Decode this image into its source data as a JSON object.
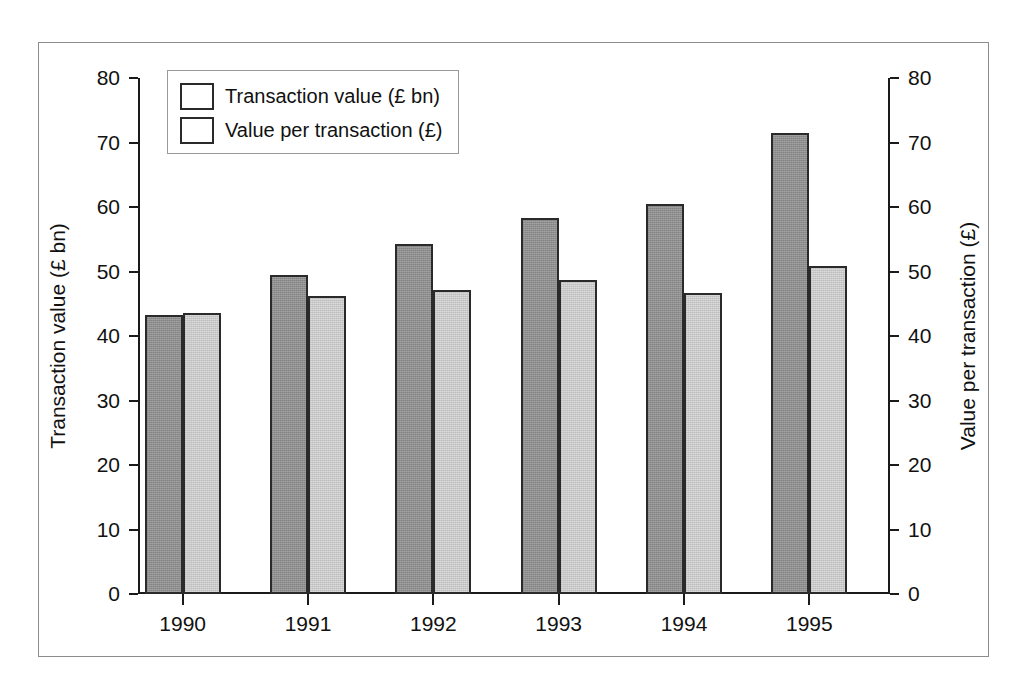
{
  "chart_data": {
    "type": "bar",
    "title": "",
    "categories": [
      "1990",
      "1991",
      "1992",
      "1993",
      "1994",
      "1995"
    ],
    "series": [
      {
        "name": "Transaction value (£ bn)",
        "axis": "left",
        "color": "#8e8e8e",
        "values": [
          43.2,
          49.4,
          54.3,
          58.3,
          60.4,
          71.4
        ]
      },
      {
        "name": "Value per transaction (£)",
        "axis": "right",
        "color": "#c9c9c9",
        "values": [
          43.5,
          46.2,
          47.1,
          48.7,
          46.6,
          50.9
        ]
      }
    ],
    "xlabel": "",
    "ylabel": "Transaction value (£ bn)",
    "y2label": "Value per transaction (£)",
    "ylim": [
      0,
      80
    ],
    "y2lim": [
      0,
      80
    ],
    "yticks": [
      "80",
      "70",
      "60",
      "50",
      "40",
      "30",
      "20",
      "10",
      "0"
    ],
    "y2ticks": [
      "80",
      "70",
      "60",
      "50",
      "40",
      "30",
      "20",
      "10",
      "0"
    ],
    "grid": false,
    "legend_position": "top-left"
  },
  "axes": {
    "left_title": "Transaction value (£ bn)",
    "right_title": "Value per transaction (£)"
  },
  "legend": {
    "items": [
      {
        "label": "Transaction value (£ bn)"
      },
      {
        "label": "Value per transaction (£)"
      }
    ]
  }
}
